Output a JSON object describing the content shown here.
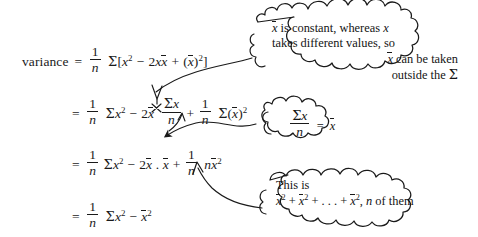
{
  "page": {
    "kind": "handwritten-style algebra derivation with cartoon thought bubbles",
    "background_color": "#ffffff",
    "ink_color": "#1a1a1a"
  },
  "derivation": {
    "label": "variance",
    "equals": "=",
    "lines": [
      {
        "id": "line-1",
        "lhs": "variance",
        "relation": "=",
        "rhs_plain": "1/n Σ[x² − 2xx̄ + (x̄)²]",
        "fraction": {
          "numerator": "1",
          "denominator": "n"
        },
        "sigma": "Σ",
        "open_bracket": "[",
        "term_1": "x²",
        "minus": "−",
        "term_2": "2xx̄",
        "plus": "+",
        "term_3": "(x̄)²",
        "close_bracket": "]"
      },
      {
        "id": "line-2",
        "lhs": "",
        "relation": "=",
        "rhs_plain": "1/n Σx² − 2x̄ (Σx)/n + 1/n Σ(x̄)²",
        "fraction_a": {
          "numerator": "1",
          "denominator": "n"
        },
        "term_1": "Σx²",
        "minus": "−",
        "coefficient": "2x̄",
        "fraction_b": {
          "numerator": "Σx",
          "denominator": "n"
        },
        "plus": "+",
        "fraction_c": {
          "numerator": "1",
          "denominator": "n"
        },
        "term_2": "Σ(x̄)²"
      },
      {
        "id": "line-3",
        "lhs": "",
        "relation": "=",
        "rhs_plain": "1/n Σx² − 2x̄ . x̄ + 1/n nx̄²",
        "fraction_a": {
          "numerator": "1",
          "denominator": "n"
        },
        "term_1": "Σx²",
        "minus": "−",
        "term_2": "2x̄ . x̄",
        "plus": "+",
        "fraction_b": {
          "numerator": "1",
          "denominator": "n"
        },
        "term_3": "nx̄²"
      },
      {
        "id": "line-4",
        "lhs": "",
        "relation": "=",
        "rhs_plain": "1/n Σx² − x̄²",
        "fraction_a": {
          "numerator": "1",
          "denominator": "n"
        },
        "term_1": "Σx²",
        "minus": "−",
        "term_2": "x̄²"
      }
    ]
  },
  "bubbles": [
    {
      "id": "bubble-top",
      "name": "annotation-bubble-constant",
      "lines": [
        "x̄ is constant, whereas x",
        "takes different values, so",
        "x̄ can be taken",
        "outside the Σ"
      ],
      "align": [
        "left",
        "left",
        "right",
        "right"
      ],
      "points_to": "line-2-sigma-x-over-n"
    },
    {
      "id": "bubble-mid",
      "name": "annotation-bubble-mean-identity",
      "lines": [
        "Σx / n = x̄"
      ],
      "fraction": {
        "numerator": "Σx",
        "denominator": "n"
      },
      "equals": "=",
      "result": "x̄",
      "points_to": "line-3-2xbar-dot-xbar"
    },
    {
      "id": "bubble-bot",
      "name": "annotation-bubble-n-copies",
      "lines": [
        "This is",
        "x̄² + x̄² + . . . + x̄², n of them"
      ],
      "align": [
        "left",
        "left"
      ],
      "points_to": "line-3-n-xbar-squared"
    }
  ],
  "arrows": [
    {
      "name": "arrow-top-bubble-to-sigma-fraction",
      "from": "bubble-top",
      "to": "line-2 Σx/n denominator"
    },
    {
      "name": "arrow-mid-bubble-to-line3-term",
      "from": "bubble-mid",
      "to": "line-3 2x̄.x̄"
    },
    {
      "name": "arrow-bot-bubble-to-nxbar2",
      "from": "bubble-bot",
      "to": "line-3 nx̄²"
    }
  ]
}
